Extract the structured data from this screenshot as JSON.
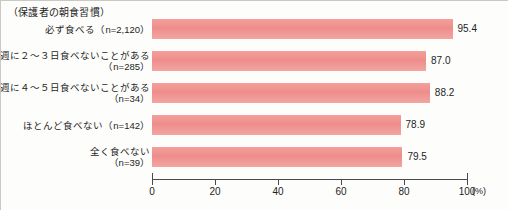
{
  "chart_data": {
    "type": "bar",
    "orientation": "horizontal",
    "title": "（保護者の朝食習慣）",
    "xlabel": "(%)",
    "ylabel": "",
    "xlim": [
      0,
      100
    ],
    "xticks": [
      0,
      20,
      40,
      60,
      80,
      100
    ],
    "xtick_labels": [
      "0",
      "20",
      "40",
      "60",
      "80",
      "100"
    ],
    "grid": false,
    "legend": null,
    "bar_color": "#f0918f",
    "categories": [
      "必ず食べる（n=2,120）",
      "週に２〜３日食べないことがある\n（n=285）",
      "週に４〜５日食べないことがある\n（n=34）",
      "ほとんど食べない（n=142）",
      "全く食べない\n（n=39）"
    ],
    "values": [
      95.4,
      87.0,
      88.2,
      78.9,
      79.5
    ],
    "value_labels": [
      "95.4",
      "87.0",
      "88.2",
      "78.9",
      "79.5"
    ],
    "sample_sizes": [
      2120,
      285,
      34,
      142,
      39
    ]
  }
}
